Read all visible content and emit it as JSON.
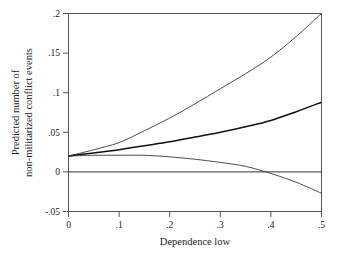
{
  "chart_data": {
    "type": "line",
    "title": "",
    "subtitle": "",
    "xlabel": "Dependence low",
    "ylabel": "Predicted number of non-militarized conflict events",
    "ylabel_line1": "Predicted number of",
    "ylabel_line2": "non-militarized conflict events",
    "xlim": [
      0,
      0.5
    ],
    "ylim": [
      -0.05,
      0.2
    ],
    "xticks": [
      0,
      0.1,
      0.2,
      0.3,
      0.4,
      0.5
    ],
    "xticklabels": [
      "0",
      ".1",
      ".2",
      ".3",
      ".4",
      ".5"
    ],
    "yticks": [
      -0.05,
      0,
      0.05,
      0.1,
      0.15,
      0.2
    ],
    "yticklabels": [
      "-.05",
      "0",
      ".05",
      ".1",
      ".15",
      ".2"
    ],
    "grid": false,
    "legend": "none",
    "reference_lines": [
      {
        "name": "zero-line",
        "axis": "y",
        "value": 0
      }
    ],
    "x": [
      0,
      0.05,
      0.1,
      0.15,
      0.2,
      0.25,
      0.3,
      0.35,
      0.4,
      0.45,
      0.5
    ],
    "series": [
      {
        "name": "upper-confidence-bound",
        "style": "thin",
        "color": "#3a3a3a",
        "values": [
          0.02,
          0.028,
          0.037,
          0.052,
          0.068,
          0.086,
          0.105,
          0.124,
          0.145,
          0.171,
          0.2
        ]
      },
      {
        "name": "predicted-mean",
        "style": "thick",
        "color": "#111111",
        "values": [
          0.02,
          0.024,
          0.028,
          0.033,
          0.038,
          0.044,
          0.05,
          0.057,
          0.065,
          0.076,
          0.088
        ]
      },
      {
        "name": "lower-confidence-bound",
        "style": "thin",
        "color": "#3a3a3a",
        "values": [
          0.02,
          0.021,
          0.021,
          0.021,
          0.019,
          0.016,
          0.012,
          0.007,
          -0.002,
          -0.013,
          -0.027
        ]
      }
    ],
    "annotations": [
      {
        "name": "lower-bound-zero-crossing",
        "x": 0.38,
        "y": 0
      }
    ],
    "colors": {
      "background": "#ffffff",
      "frame": "#555555",
      "text": "#1a1a1a",
      "mean_line": "#111111",
      "bound_line": "#3a3a3a"
    }
  }
}
